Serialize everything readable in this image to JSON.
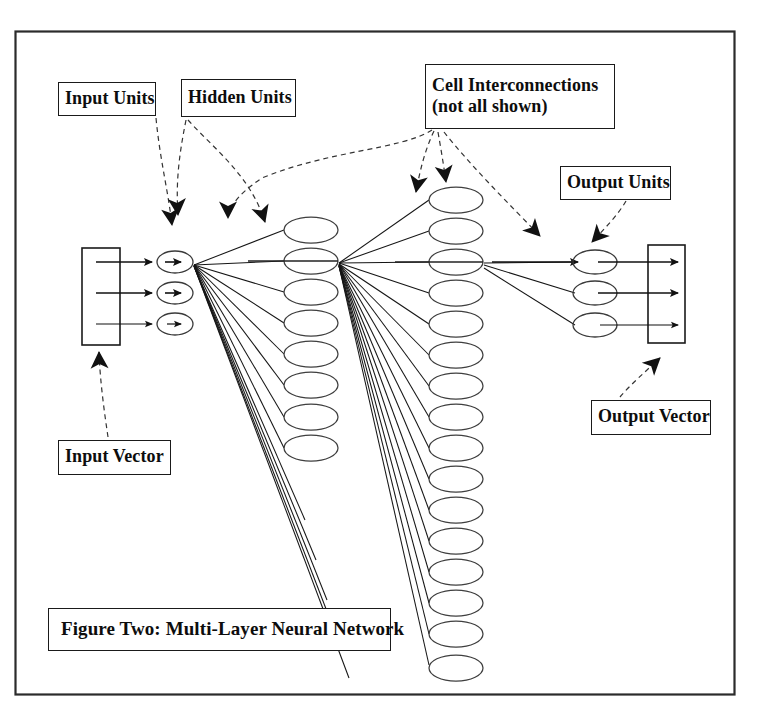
{
  "figure": {
    "title": "Figure Two: Multi-Layer Neural Network",
    "border_color": "#2b2b2b",
    "background": "#ffffff",
    "ink_color": "#1a1a1a"
  },
  "labels": {
    "input_units": "Input Units",
    "hidden_units": "Hidden Units",
    "cell_interconnections_line1": "Cell Interconnections",
    "cell_interconnections_line2": "(not all shown)",
    "output_units": "Output Units",
    "output_vector": "Output Vector",
    "input_vector": "Input Vector",
    "caption": "Figure Two: Multi-Layer Neural Network"
  },
  "diagram": {
    "type": "neural-network",
    "layers": [
      {
        "name": "input",
        "node_count": 3,
        "center_x": 175,
        "first_y": 262,
        "spacing": 31,
        "rx": 18,
        "ry": 11
      },
      {
        "name": "hidden1",
        "node_count": 8,
        "center_x": 311,
        "first_y": 230,
        "spacing": 31,
        "rx": 27,
        "ry": 13
      },
      {
        "name": "hidden2",
        "node_count": 16,
        "center_x": 456,
        "first_y": 200,
        "spacing": 31,
        "rx": 27,
        "ry": 13
      },
      {
        "name": "output",
        "node_count": 3,
        "center_x": 595,
        "first_y": 262,
        "spacing": 31,
        "rx": 22,
        "ry": 12
      }
    ],
    "input_vector_box": {
      "x": 82,
      "y": 248,
      "w": 38,
      "h": 97
    },
    "output_vector_box": {
      "x": 648,
      "y": 245,
      "w": 37,
      "h": 98
    },
    "fan_source_hidden1_index": 0,
    "fan_source_hidden2_index": 2,
    "fan_target_output_index": 0,
    "annotation_arrows": [
      {
        "from": "input_units_label",
        "to": "input_node_0"
      },
      {
        "from": "hidden_units_label",
        "to": "hidden1_node_0"
      },
      {
        "from": "hidden_units_label",
        "to": "hidden1_node_1_left"
      },
      {
        "from": "cell_interconnections_label",
        "to": "hidden2_node_0"
      },
      {
        "from": "cell_interconnections_label",
        "to": "hidden1_to_hidden2_edge"
      },
      {
        "from": "cell_interconnections_label",
        "to": "hidden2_to_output_edge"
      },
      {
        "from": "output_units_label",
        "to": "output_node_0"
      },
      {
        "from": "input_vector_label",
        "to": "input_vector_box"
      },
      {
        "from": "output_vector_label",
        "to": "output_vector_box"
      }
    ]
  }
}
